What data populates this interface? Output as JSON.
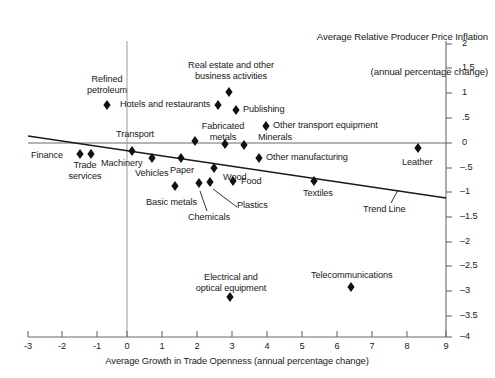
{
  "chart_data": {
    "type": "scatter",
    "title": "Average Relative Producer Price Inflation\n(annual percentage change)",
    "title_line1": "Average Relative Producer Price Inflation",
    "title_line2": "(annual percentage change)",
    "xlabel": "Average Growth in Trade Openness (annual percentage change)",
    "ylabel": "Average Relative Producer Price Inflation (annual percentage change)",
    "xlim": [
      -3,
      9
    ],
    "ylim": [
      -4,
      2
    ],
    "xticks": [
      -3,
      -2,
      -1,
      0,
      1,
      2,
      3,
      4,
      5,
      6,
      7,
      8,
      9
    ],
    "xticklabels": [
      "-3",
      "-2",
      "-1",
      "0",
      "1",
      "2",
      "3",
      "4",
      "5",
      "6",
      "7",
      "8",
      "9"
    ],
    "yticks": [
      2,
      1.5,
      1,
      0.5,
      0,
      -0.5,
      -1,
      -1.5,
      -2,
      -2.5,
      -3,
      -3.5,
      -4
    ],
    "yticklabels": [
      "2",
      "1.5",
      "1",
      ".5",
      "0",
      "–.5",
      "–1",
      "–1.5",
      "–2",
      "–2.5",
      "–3",
      "–3.5",
      "–4"
    ],
    "y_axis_position": "right",
    "grid": false,
    "legend": false,
    "marker": "diamond",
    "marker_color": "#111111",
    "axis_color": "#6b6b6b",
    "zero_lines": {
      "x": 0,
      "y": 0
    },
    "points": [
      {
        "label": "Refined petroleum",
        "x": -0.5,
        "y": 0.95
      },
      {
        "label": "Hotels and restaurants",
        "x": 2.6,
        "y": 0.95
      },
      {
        "label": "Real estate and other business activities",
        "x": 2.9,
        "y": 1.2
      },
      {
        "label": "Publishing",
        "x": 3.1,
        "y": 0.85
      },
      {
        "label": "Other transport equipment",
        "x": 3.95,
        "y": 0.35
      },
      {
        "label": "Transport",
        "x": 1.95,
        "y": 0.05
      },
      {
        "label": "Fabricated metals",
        "x": 2.8,
        "y": -0.02
      },
      {
        "label": "Minerals",
        "x": 3.35,
        "y": -0.05
      },
      {
        "label": "Finance",
        "x": -1.35,
        "y": -0.22
      },
      {
        "label": "Trade services",
        "x": -1.05,
        "y": -0.22
      },
      {
        "label": "Machinery",
        "x": 0.15,
        "y": -0.15
      },
      {
        "label": "Vehicles",
        "x": 0.7,
        "y": -0.3
      },
      {
        "label": "Paper",
        "x": 1.55,
        "y": -0.3
      },
      {
        "label": "Other manufacturing",
        "x": 3.75,
        "y": -0.3
      },
      {
        "label": "Leather",
        "x": 8.3,
        "y": -0.1
      },
      {
        "label": "Wood",
        "x": 2.5,
        "y": -0.5
      },
      {
        "label": "Food",
        "x": 3.05,
        "y": -0.75
      },
      {
        "label": "Textiles",
        "x": 5.35,
        "y": -0.75
      },
      {
        "label": "Chemicals",
        "x": 2.05,
        "y": -0.8
      },
      {
        "label": "Plastics",
        "x": 2.25,
        "y": -0.78
      },
      {
        "label": "Basic metals",
        "x": 1.5,
        "y": -1.0
      },
      {
        "label": "Electrical and optical equipment",
        "x": 2.95,
        "y": -3.1
      },
      {
        "label": "Telecommunications",
        "x": 6.4,
        "y": -2.9
      }
    ],
    "trend_line": {
      "label": "Trend Line",
      "x_start": -2.7,
      "y_start": 0.15,
      "x_end": 9.0,
      "y_end": -1.1
    },
    "annotations": [
      {
        "name": "chemicals-leader",
        "label": "Chemicals"
      },
      {
        "name": "plastics-leader",
        "label": "Plastics"
      },
      {
        "name": "trend-leader",
        "label": "Trend Line"
      }
    ]
  }
}
